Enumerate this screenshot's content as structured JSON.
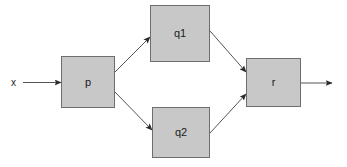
{
  "diagram": {
    "type": "block-diagram",
    "background_color": "#ffffff",
    "node_fill_color": "#c8c8c8",
    "node_border_color": "#6e6e6e",
    "edge_color": "#555555",
    "text_color": "#1a1a1a",
    "nodes": [
      {
        "id": "p",
        "label": "p",
        "x": 61,
        "y": 56,
        "width": 54,
        "height": 52
      },
      {
        "id": "q1",
        "label": "q1",
        "x": 150,
        "y": 5,
        "width": 60,
        "height": 57
      },
      {
        "id": "q2",
        "label": "q2",
        "x": 152,
        "y": 107,
        "width": 58,
        "height": 51
      },
      {
        "id": "r",
        "label": "r",
        "x": 246,
        "y": 58,
        "width": 55,
        "height": 49
      }
    ],
    "io_labels": [
      {
        "id": "x",
        "label": "x",
        "x": 11,
        "y": 78
      }
    ],
    "edges": [
      {
        "id": "x-to-p",
        "from": "x",
        "to": "p",
        "label": ""
      },
      {
        "id": "p-to-q1",
        "from": "p",
        "to": "q1",
        "label": ""
      },
      {
        "id": "p-to-q2",
        "from": "p",
        "to": "q2",
        "label": ""
      },
      {
        "id": "q1-to-r",
        "from": "q1",
        "to": "r",
        "label": ""
      },
      {
        "id": "q2-to-r",
        "from": "q2",
        "to": "r",
        "label": ""
      },
      {
        "id": "r-out",
        "from": "r",
        "to": "",
        "label": ""
      }
    ]
  }
}
